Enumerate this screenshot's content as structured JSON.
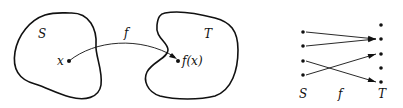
{
  "left_figure": {
    "domain_label": "S",
    "codomain_label": "T",
    "map_label": "f",
    "point_label": "x",
    "image_label": "f(x)"
  },
  "right_figure": {
    "domain_label": "S",
    "map_label": "f",
    "codomain_label": "T",
    "domain_points": 4,
    "codomain_points": 5,
    "mappings": [
      [
        0,
        1
      ],
      [
        1,
        1
      ],
      [
        2,
        4
      ],
      [
        3,
        2
      ]
    ]
  }
}
